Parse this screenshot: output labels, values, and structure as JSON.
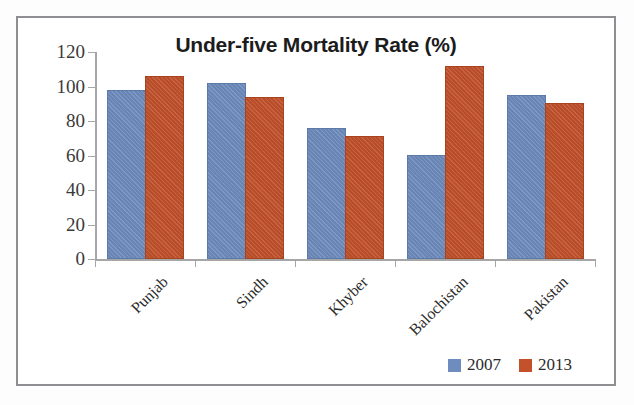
{
  "chart_data": {
    "type": "bar",
    "title": "Under-five Mortality Rate (%)",
    "xlabel": "",
    "ylabel": "",
    "categories": [
      "Punjab",
      "Sindh",
      "Khyber",
      "Balochistan",
      "Pakistan"
    ],
    "series": [
      {
        "name": "2007",
        "color": "#6f8cbe",
        "values": [
          97,
          101,
          75,
          59,
          94
        ]
      },
      {
        "name": "2013",
        "color": "#c2512c",
        "values": [
          105,
          93,
          70,
          111,
          89
        ]
      }
    ],
    "ylim": [
      0,
      120
    ],
    "yticks": [
      0,
      20,
      40,
      60,
      80,
      100,
      120
    ],
    "ytick_labels": [
      "0",
      "20",
      "40",
      "60",
      "80",
      "100",
      "120"
    ],
    "grid": false,
    "legend_position": "bottom-right",
    "legend_entries": [
      "2007",
      "2013"
    ],
    "axis_color": "#a6a6a6",
    "frame_color": "#8f8f93",
    "background": "#ffffff"
  }
}
